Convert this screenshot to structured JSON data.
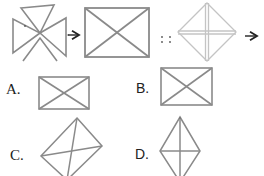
{
  "question": {
    "analogy_separator": "::",
    "stroke_color": "#8a8a8a",
    "light_stroke_color": "#c4c4c4",
    "arrow_color": "#222222",
    "figures": [
      {
        "id": "fig1",
        "description": "four triangles meeting at center (pinwheel cross)"
      },
      {
        "id": "fig2",
        "description": "rectangle with both diagonals"
      },
      {
        "id": "fig3",
        "description": "diamond with vertical and horizontal crosshair (light gray)"
      }
    ]
  },
  "options": [
    {
      "label": "A.",
      "description": "rectangle with both diagonals"
    },
    {
      "label": "B.",
      "description": "rectangle with both diagonals"
    },
    {
      "label": "C.",
      "description": "tilted quadrilateral with diagonals"
    },
    {
      "label": "D.",
      "description": "kite with vertical and horizontal diagonals"
    }
  ]
}
